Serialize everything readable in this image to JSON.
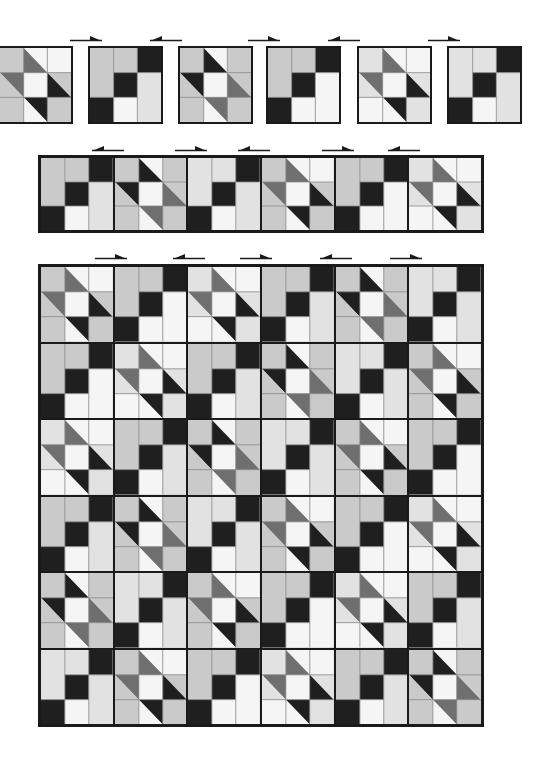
{
  "figure": {
    "colors": {
      "white": "#f5f5f5",
      "light": "#cacaca",
      "pale": "#e2e2e2",
      "medium": "#6f6f6f",
      "dark": "#1f1f1f",
      "seam": "#8a8a8a",
      "border": "#1a1a1a"
    },
    "block_types": {
      "A": {
        "name": "chain block",
        "cells": [
          [
            "light-tall",
            "light",
            "dark"
          ],
          [
            "light-tall",
            "dark",
            "light-tall2"
          ],
          [
            "dark",
            "white",
            "light-tall2"
          ]
        ]
      },
      "B": {
        "name": "diagonal block",
        "cells": [
          [
            "light",
            "hst-dl",
            "light"
          ],
          [
            "hst-ur",
            "white",
            "hst-dl"
          ],
          [
            "light",
            "hst-ur",
            "light"
          ]
        ]
      }
    },
    "top_row": {
      "blocks": [
        {
          "type": "B",
          "x": -2,
          "y": 46,
          "w": 75,
          "h": 78,
          "variant": 0
        },
        {
          "type": "A",
          "x": 88,
          "y": 46,
          "w": 75,
          "h": 78,
          "variant": 0
        },
        {
          "type": "B",
          "x": 178,
          "y": 46,
          "w": 75,
          "h": 78,
          "variant": 1
        },
        {
          "type": "A",
          "x": 266,
          "y": 46,
          "w": 75,
          "h": 78,
          "variant": 1
        },
        {
          "type": "B",
          "x": 357,
          "y": 46,
          "w": 75,
          "h": 78,
          "variant": 2
        },
        {
          "type": "A",
          "x": 447,
          "y": 46,
          "w": 75,
          "h": 78,
          "variant": 2
        }
      ],
      "arrows": [
        {
          "dir": "right",
          "x": 70,
          "y": 34,
          "w": 32
        },
        {
          "dir": "left",
          "x": 150,
          "y": 34,
          "w": 32
        },
        {
          "dir": "right",
          "x": 248,
          "y": 34,
          "w": 32
        },
        {
          "dir": "left",
          "x": 328,
          "y": 34,
          "w": 32
        },
        {
          "dir": "right",
          "x": 428,
          "y": 34,
          "w": 32
        }
      ]
    },
    "strip_row": {
      "x": 38,
      "y": 155,
      "w": 446,
      "h": 78,
      "sequence": [
        "A",
        "B",
        "A",
        "B",
        "A",
        "B"
      ],
      "arrows": [
        {
          "dir": "left",
          "x": 92,
          "y": 144,
          "w": 32
        },
        {
          "dir": "right",
          "x": 175,
          "y": 144,
          "w": 32
        },
        {
          "dir": "left",
          "x": 238,
          "y": 144,
          "w": 32
        },
        {
          "dir": "right",
          "x": 322,
          "y": 144,
          "w": 32
        },
        {
          "dir": "left",
          "x": 388,
          "y": 144,
          "w": 32
        }
      ]
    },
    "quilt_top": {
      "x": 38,
      "y": 264,
      "w": 446,
      "h": 463,
      "rows": 6,
      "cols": 6,
      "layout": [
        [
          "B",
          "A",
          "B",
          "A",
          "B",
          "A"
        ],
        [
          "A",
          "B",
          "A",
          "B",
          "A",
          "B"
        ],
        [
          "B",
          "A",
          "B",
          "A",
          "B",
          "A"
        ],
        [
          "A",
          "B",
          "A",
          "B",
          "A",
          "B"
        ],
        [
          "B",
          "A",
          "B",
          "A",
          "B",
          "A"
        ],
        [
          "A",
          "B",
          "A",
          "B",
          "A",
          "B"
        ]
      ],
      "arrows": [
        {
          "dir": "right",
          "x": 95,
          "y": 252,
          "w": 32
        },
        {
          "dir": "left",
          "x": 173,
          "y": 252,
          "w": 32
        },
        {
          "dir": "right",
          "x": 240,
          "y": 252,
          "w": 32
        },
        {
          "dir": "left",
          "x": 320,
          "y": 252,
          "w": 32
        },
        {
          "dir": "right",
          "x": 390,
          "y": 252,
          "w": 32
        }
      ]
    }
  }
}
